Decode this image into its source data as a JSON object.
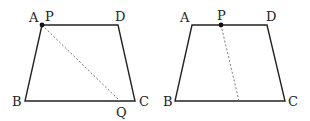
{
  "figures": [
    {
      "id": "left-trapezoid",
      "vertices": {
        "A": {
          "label": "A",
          "x": 42,
          "y": 25,
          "lx": 29,
          "ly": 22
        },
        "D": {
          "label": "D",
          "x": 118,
          "y": 25,
          "lx": 115,
          "ly": 21
        },
        "B": {
          "label": "B",
          "x": 25,
          "y": 101,
          "lx": 12,
          "ly": 106
        },
        "C": {
          "label": "C",
          "x": 135,
          "y": 101,
          "lx": 139,
          "ly": 106
        }
      },
      "points": {
        "P": {
          "label": "P",
          "x": 42,
          "y": 25,
          "lx": 45,
          "ly": 21
        },
        "Q": {
          "label": "Q",
          "x": 120,
          "y": 101,
          "lx": 116,
          "ly": 117
        }
      },
      "dashed_segment": {
        "from": "P",
        "to": "Q",
        "x1": 42,
        "y1": 25,
        "x2": 120,
        "y2": 101
      }
    },
    {
      "id": "right-trapezoid",
      "vertices": {
        "A": {
          "label": "A",
          "x": 192,
          "y": 25,
          "lx": 180,
          "ly": 22
        },
        "D": {
          "label": "D",
          "x": 267,
          "y": 25,
          "lx": 266,
          "ly": 21
        },
        "B": {
          "label": "B",
          "x": 175,
          "y": 101,
          "lx": 163,
          "ly": 106
        },
        "C": {
          "label": "C",
          "x": 285,
          "y": 101,
          "lx": 288,
          "ly": 106
        }
      },
      "points": {
        "P": {
          "label": "P",
          "x": 221,
          "y": 25,
          "lx": 217,
          "ly": 20
        }
      },
      "dashed_segment": {
        "from": "P",
        "to": "BC",
        "x1": 221,
        "y1": 25,
        "x2": 239,
        "y2": 101
      }
    }
  ],
  "colors": {
    "stroke": "#222222",
    "dashed": "#777777",
    "point": "#111111"
  }
}
